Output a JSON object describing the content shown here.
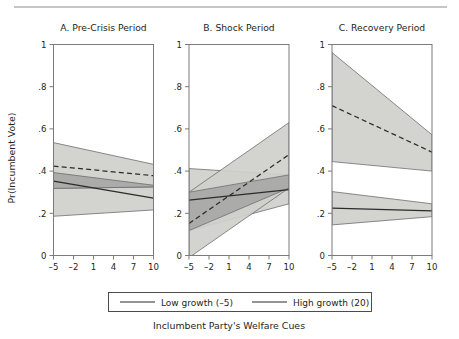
{
  "figure": {
    "xlabel": "Inclumbent Party's Welfare Cues",
    "ylabel": "Pr(Incumbent Vote)",
    "top_rule": true
  },
  "legend": {
    "entries": [
      {
        "label": "Low growth (–5)",
        "style": "solid"
      },
      {
        "label": "High growth (20)",
        "style": "solid"
      }
    ]
  },
  "chart_data": {
    "type": "line",
    "title": "",
    "xlabel": "Inclumbent Party's Welfare Cues",
    "ylabel": "Pr(Incumbent Vote)",
    "xlim": [
      -5,
      10
    ],
    "ylim": [
      0,
      1
    ],
    "xticks": [
      -5,
      -2,
      1,
      4,
      7,
      10
    ],
    "xtick_labels": [
      "–5",
      "–2",
      "1",
      "4",
      "7",
      "10"
    ],
    "yticks": [
      0,
      0.2,
      0.4,
      0.6,
      0.8,
      1
    ],
    "ytick_labels": [
      "0",
      ".2",
      ".4",
      ".6",
      ".8",
      "1"
    ],
    "grid": false,
    "legend_position": "bottom",
    "panels": [
      {
        "id": "A",
        "title": "A. Pre-Crisis Period",
        "x": [
          -5,
          10
        ],
        "series": [
          {
            "name": "Low growth (–5)",
            "style": "solid",
            "values": [
              0.352,
              0.272
            ],
            "ci_upper": [
              0.393,
              0.333
            ],
            "ci_lower": [
              0.186,
              0.216
            ],
            "band": "light"
          },
          {
            "name": "High growth (20)",
            "style": "dashed",
            "values": [
              0.424,
              0.378
            ],
            "ci_upper": [
              0.535,
              0.432
            ],
            "ci_lower": [
              0.318,
              0.325
            ],
            "band": "light"
          }
        ]
      },
      {
        "id": "B",
        "title": "B. Shock Period",
        "x": [
          -5,
          10
        ],
        "series": [
          {
            "name": "Low growth (–5)",
            "style": "solid",
            "values": [
              0.262,
              0.312
            ],
            "ci_upper": [
              0.412,
              0.382
            ],
            "ci_lower": [
              0.118,
              0.245
            ],
            "band": "light"
          },
          {
            "name": "High growth (20)",
            "style": "dashed",
            "values": [
              0.152,
              0.478
            ],
            "ci_upper": [
              0.3,
              0.63
            ],
            "ci_lower": [
              -0.01,
              0.32
            ],
            "band": "light"
          }
        ]
      },
      {
        "id": "C",
        "title": "C. Recovery Period",
        "x": [
          -5,
          10
        ],
        "series": [
          {
            "name": "Low growth (–5)",
            "style": "solid",
            "values": [
              0.225,
              0.212
            ],
            "ci_upper": [
              0.303,
              0.245
            ],
            "ci_lower": [
              0.145,
              0.184
            ],
            "band": "light"
          },
          {
            "name": "High growth (20)",
            "style": "dashed",
            "values": [
              0.71,
              0.49
            ],
            "ci_upper": [
              0.962,
              0.572
            ],
            "ci_lower": [
              0.445,
              0.4
            ],
            "band": "light"
          }
        ]
      }
    ]
  }
}
